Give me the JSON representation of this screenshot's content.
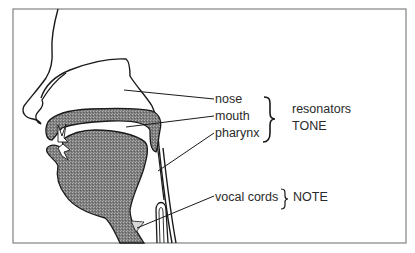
{
  "diagram": {
    "labels": {
      "nose": "nose",
      "mouth": "mouth",
      "pharynx": "pharynx",
      "vocal_cords": "vocal cords"
    },
    "groups": {
      "resonators_title": "resonators",
      "resonators_sub": "TONE",
      "note": "NOTE"
    },
    "colors": {
      "outline": "#1a1a1a",
      "tissue_fill": "#8a8a8a",
      "frame": "#8c8c8c",
      "background": "#ffffff"
    }
  }
}
